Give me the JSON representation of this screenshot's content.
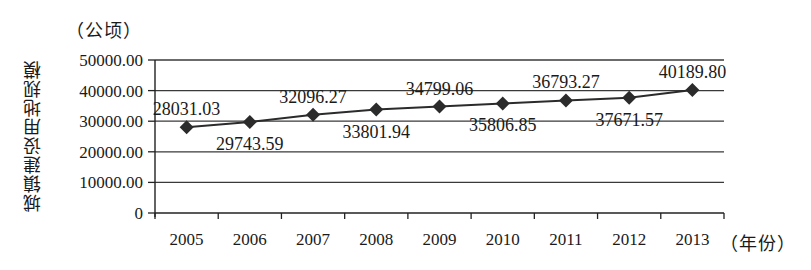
{
  "chart_data": {
    "type": "line",
    "title": "",
    "unit_label": "（公顷）",
    "xlabel": "（年份）",
    "ylabel": "城镇建设用地规模",
    "categories": [
      "2005",
      "2006",
      "2007",
      "2008",
      "2009",
      "2010",
      "2011",
      "2012",
      "2013"
    ],
    "series": [
      {
        "name": "城镇建设用地规模",
        "values": [
          28031.03,
          29743.59,
          32096.27,
          33801.94,
          34799.06,
          35806.85,
          36793.27,
          37671.57,
          40189.8
        ],
        "labels": [
          "28031.03",
          "29743.59",
          "32096.27",
          "33801.94",
          "34799.06",
          "35806.85",
          "36793.27",
          "37671.57",
          "40189.80"
        ],
        "label_positions": [
          "above",
          "below",
          "above",
          "below",
          "above",
          "below",
          "above",
          "below",
          "above"
        ],
        "marker": "diamond",
        "color": "#2b2b2b"
      }
    ],
    "yticks": [
      0,
      10000,
      20000,
      30000,
      40000,
      50000
    ],
    "ytick_labels": [
      "0",
      "10000.00",
      "20000.00",
      "30000.00",
      "40000.00",
      "50000.00"
    ],
    "ylim": [
      0,
      50000
    ],
    "grid": true,
    "legend": "none"
  },
  "labels": {
    "unit": "（公顷）",
    "ylabel": "城镇建设用地规模",
    "xunit": "（年份）"
  }
}
